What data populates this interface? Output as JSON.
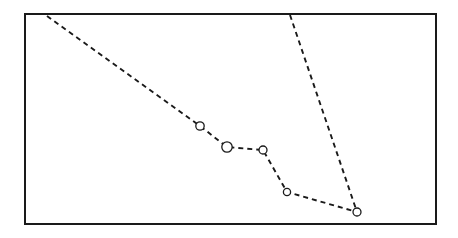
{
  "figure": {
    "background_color": "#ffffff",
    "line_color": "#1a1a1a",
    "frame_color": "#1a1a1a",
    "frame": {
      "x": 25,
      "y": 14,
      "width": 411,
      "height": 210,
      "stroke_width": 2
    }
  },
  "chart_data": {
    "type": "line",
    "title": "",
    "subtitle": "",
    "xlabel": "",
    "ylabel": "",
    "xlim": [
      25,
      436
    ],
    "ylim": [
      224,
      14
    ],
    "grid": false,
    "legend": null,
    "axis_ticks": {
      "x": [],
      "y": []
    },
    "annotations": [],
    "style": {
      "linestyle": "dashed",
      "dash_pattern": "5,4",
      "line_width": 1.9,
      "marker": "circle-open",
      "marker_face_color": "#ffffff",
      "marker_edge_color": "#1a1a1a",
      "marker_edge_width": 1.3
    },
    "series": [
      {
        "name": "series-1",
        "linestyle": "dashed",
        "marker": "circle-open",
        "points": [
          {
            "x": 47,
            "y": 16,
            "marker": false,
            "marker_radius": 0
          },
          {
            "x": 200,
            "y": 126,
            "marker": true,
            "marker_radius": 4.2
          },
          {
            "x": 227,
            "y": 147,
            "marker": true,
            "marker_radius": 5.2
          },
          {
            "x": 263,
            "y": 150,
            "marker": true,
            "marker_radius": 4.0
          },
          {
            "x": 287,
            "y": 192,
            "marker": true,
            "marker_radius": 3.6
          },
          {
            "x": 357,
            "y": 212,
            "marker": true,
            "marker_radius": 4.0
          }
        ]
      },
      {
        "name": "series-2",
        "linestyle": "dashed",
        "marker": "none",
        "points": [
          {
            "x": 290,
            "y": 15,
            "marker": false,
            "marker_radius": 0
          },
          {
            "x": 357,
            "y": 212,
            "marker": false,
            "marker_radius": 0
          }
        ]
      }
    ]
  }
}
